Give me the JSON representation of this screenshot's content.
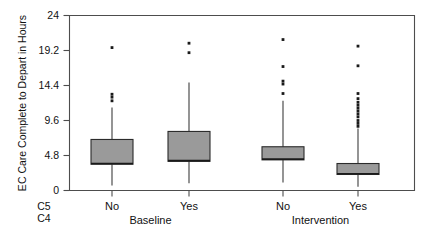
{
  "chart_data": {
    "type": "box",
    "title": "",
    "xlabel": "",
    "ylabel": "EC Care Complete to Depart in Hours",
    "ylim": [
      0,
      24
    ],
    "yticks": [
      0,
      4.8,
      9.6,
      14.4,
      19.2,
      24
    ],
    "ytick_labels": [
      "0",
      "4.8",
      "9.6",
      "14.4",
      "19.2",
      "24"
    ],
    "grid": false,
    "legend": "none",
    "panel_variable_label": "C4",
    "category_variable_label": "C5",
    "panels": [
      "Baseline",
      "Intervention"
    ],
    "categories": [
      "No",
      "Yes",
      "No",
      "Yes"
    ],
    "boxes": [
      {
        "panel": "Baseline",
        "category": "No",
        "whisker_low": 0.7,
        "q1": 3.6,
        "median": 3.7,
        "q3": 7.0,
        "whisker_high": 11.4,
        "outliers": [
          12.3,
          12.8,
          13.2,
          19.6
        ]
      },
      {
        "panel": "Baseline",
        "category": "Yes",
        "whisker_low": 1.0,
        "q1": 4.0,
        "median": 4.1,
        "q3": 8.1,
        "whisker_high": 14.8,
        "outliers": [
          18.9,
          20.2
        ]
      },
      {
        "panel": "Intervention",
        "category": "No",
        "whisker_low": 1.1,
        "q1": 4.2,
        "median": 4.3,
        "q3": 6.0,
        "whisker_high": 12.3,
        "outliers": [
          13.3,
          14.6,
          15.0,
          17.0,
          20.7
        ]
      },
      {
        "panel": "Intervention",
        "category": "Yes",
        "whisker_low": 0.5,
        "q1": 2.2,
        "median": 2.3,
        "q3": 3.7,
        "whisker_high": 8.5,
        "outliers": [
          8.8,
          9.2,
          9.6,
          10.1,
          10.5,
          10.9,
          11.3,
          11.7,
          12.1,
          12.6,
          13.3,
          17.1,
          19.8
        ]
      }
    ],
    "colors": {
      "box_fill": "#9a9a9a",
      "box_edge": "#2b2b2b",
      "axis": "#4d4d4d",
      "text": "#111111",
      "background": "#ffffff"
    }
  }
}
